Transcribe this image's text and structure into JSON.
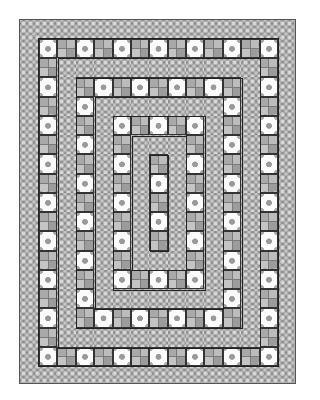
{
  "image": {
    "subject": "quilt-pattern",
    "description": "Concentric rectangular quilt with alternating rings of pieced blocks and printed fabric strips"
  },
  "quilt": {
    "grid_columns": 13,
    "grid_rows": 17,
    "outer_border": "fabric",
    "rings": [
      {
        "index": 0,
        "type": "blocks",
        "corner_block": "dot"
      },
      {
        "index": 1,
        "type": "fabric"
      },
      {
        "index": 2,
        "type": "blocks",
        "corner_block": "check"
      },
      {
        "index": 3,
        "type": "fabric"
      },
      {
        "index": 4,
        "type": "blocks",
        "corner_block": "dot"
      },
      {
        "index": 5,
        "type": "fabric"
      },
      {
        "index": 6,
        "type": "blocks",
        "corner_block": "check"
      }
    ],
    "block_types": {
      "dot": "white-square-with-grey-dots",
      "check": "four-patch-grey-squares",
      "fabric": "grey-circle-print"
    },
    "colors": {
      "background": "#ffffff",
      "fabric": "#8a8a8a",
      "fabric_circle": "#cfcfcf",
      "dot_block": "#fbfbfb",
      "dot": "#a0a0a0",
      "check_light": "#c4c4c4",
      "check_dark": "#9c9c9c",
      "seam": "#222222"
    }
  }
}
